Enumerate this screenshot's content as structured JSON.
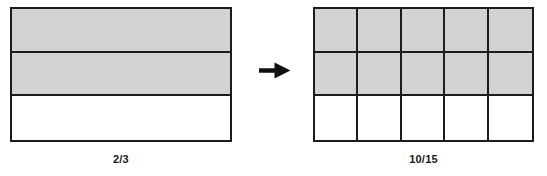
{
  "figure": {
    "type": "equivalent-fractions-area-model",
    "background_color": "#ffffff",
    "shade_color": "#d2d2d2",
    "line_color": "#1c1c1c",
    "arrow": {
      "icon": "right-arrow-icon",
      "direction": "right",
      "color": "#111111",
      "x": 259,
      "y": 62,
      "width": 32,
      "height": 17
    },
    "models": [
      {
        "id": "left-model",
        "name": "two-thirds-model",
        "label": "2/3",
        "numerator": 2,
        "denominator": 3,
        "rows": 3,
        "cols": 1,
        "shaded_cells": 2,
        "total_cells": 3,
        "shaded_map": [
          [
            true
          ],
          [
            true
          ],
          [
            false
          ]
        ],
        "x": 10,
        "y": 7,
        "width": 222,
        "height": 135,
        "label_y": 153
      },
      {
        "id": "right-model",
        "name": "ten-fifteenths-model",
        "label": "10/15",
        "numerator": 10,
        "denominator": 15,
        "rows": 3,
        "cols": 5,
        "shaded_cells": 10,
        "total_cells": 15,
        "shaded_map": [
          [
            true,
            true,
            true,
            true,
            true
          ],
          [
            true,
            true,
            true,
            true,
            true
          ],
          [
            false,
            false,
            false,
            false,
            false
          ]
        ],
        "x": 313,
        "y": 7,
        "width": 221,
        "height": 135,
        "label_y": 153
      }
    ]
  }
}
